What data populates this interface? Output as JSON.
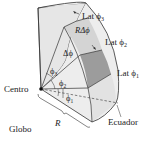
{
  "diagram": {
    "labels": {
      "lat3": "Lat ϕ3",
      "lat3_main": "Lat ϕ",
      "lat3_sub": "3",
      "lat2_main": "Lat ϕ",
      "lat2_sub": "2",
      "lat1_main": "Lat ϕ",
      "lat1_sub": "1",
      "r_delta_phi": "RΔϕ",
      "delta_phi": "Δϕ",
      "phi3_main": "ϕ",
      "phi3_sub": "3",
      "phi2_main": "ϕ",
      "phi2_sub": "2",
      "phi1_main": "ϕ",
      "phi1_sub": "1",
      "center": "Centro",
      "radius": "R",
      "equator": "Ecuador",
      "globe": "Globo"
    },
    "colors": {
      "surface_light": "#ececec",
      "surface_mid": "#d9d9d9",
      "band_shaded": "#cfcfcf",
      "patch_dark": "#9a9a9a",
      "line": "#333333"
    }
  }
}
